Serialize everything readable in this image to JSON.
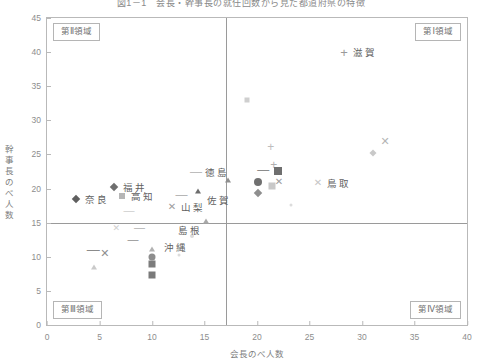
{
  "chart": {
    "title": "図1－1　会長・幹事長の就任回数から見た都道府県の特徴",
    "xlabel": "会長のべ人数",
    "ylabel": "幹事長のべ人数",
    "xlim": [
      0,
      40
    ],
    "ylim": [
      0,
      45
    ],
    "xticks": [
      0,
      5,
      10,
      15,
      20,
      25,
      30,
      35,
      40
    ],
    "yticks": [
      0,
      5,
      10,
      15,
      20,
      25,
      30,
      35,
      40,
      45
    ],
    "divider_x": 17,
    "divider_y": 15,
    "grid": false,
    "legend": "none",
    "axis_color": "#b9b9b9",
    "divider_color": "#9a9a9a",
    "text_color": "#6b6b6b"
  },
  "quadrants": [
    {
      "key": "q1",
      "label": "第Ⅰ領域"
    },
    {
      "key": "q2",
      "label": "第Ⅱ領域"
    },
    {
      "key": "q3",
      "label": "第Ⅲ領域"
    },
    {
      "key": "q4",
      "label": "第Ⅳ領域"
    }
  ],
  "chart_data": {
    "type": "scatter",
    "title": "図1－1　会長・幹事長の就任回数から見た都道府県の特徴",
    "xlabel": "会長のべ人数",
    "ylabel": "幹事長のべ人数",
    "xlim": [
      0,
      40
    ],
    "ylim": [
      0,
      45
    ],
    "xticks": [
      0,
      5,
      10,
      15,
      20,
      25,
      30,
      35,
      40
    ],
    "yticks": [
      0,
      5,
      10,
      15,
      20,
      25,
      30,
      35,
      40,
      45
    ],
    "reference_lines": {
      "vertical_x": 17,
      "horizontal_y": 15
    },
    "quadrant_labels": {
      "top_right": "第Ⅰ領域",
      "top_left": "第Ⅱ領域",
      "bottom_left": "第Ⅲ領域",
      "bottom_right": "第Ⅳ領域"
    },
    "points": [
      {
        "x": 28.3,
        "y": 40.0,
        "marker": "plus",
        "size": 9,
        "color": "#9a9a9a",
        "label": "滋賀",
        "label_dx": 9,
        "label_dy": 0
      },
      {
        "x": 19.0,
        "y": 33.0,
        "marker": "square",
        "size": 5,
        "color": "#cfcfcf",
        "label": ""
      },
      {
        "x": 32.2,
        "y": 27.0,
        "marker": "x",
        "size": 9,
        "color": "#b5b5b5",
        "label": ""
      },
      {
        "x": 21.3,
        "y": 26.2,
        "marker": "plus",
        "size": 8,
        "color": "#bdbdbd",
        "label": ""
      },
      {
        "x": 31.0,
        "y": 25.2,
        "marker": "diamond",
        "size": 5,
        "color": "#c9c9c9",
        "label": ""
      },
      {
        "x": 21.6,
        "y": 23.5,
        "marker": "plus",
        "size": 8,
        "color": "#b0b0b0",
        "label": ""
      },
      {
        "x": 22.0,
        "y": 22.6,
        "marker": "square",
        "size": 8,
        "color": "#6f6f6f",
        "label": ""
      },
      {
        "x": 20.6,
        "y": 22.7,
        "marker": "dash",
        "size": 8,
        "color": "#8c8c8c",
        "label": ""
      },
      {
        "x": 14.2,
        "y": 22.5,
        "marker": "dash",
        "size": 8,
        "color": "#bdbdbd",
        "label": "徳島",
        "label_dx": 9,
        "label_dy": 0
      },
      {
        "x": 17.2,
        "y": 21.2,
        "marker": "tri",
        "size": 7,
        "color": "#8f8f8f",
        "label": ""
      },
      {
        "x": 20.1,
        "y": 21.0,
        "marker": "circle",
        "size": 8,
        "color": "#707070",
        "label": ""
      },
      {
        "x": 22.1,
        "y": 21.0,
        "marker": "x",
        "size": 8,
        "color": "#9d9d9d",
        "label": ""
      },
      {
        "x": 25.8,
        "y": 20.8,
        "marker": "x",
        "size": 8,
        "color": "#c6c6c6",
        "label": "鳥取",
        "label_dx": 9,
        "label_dy": 0
      },
      {
        "x": 21.4,
        "y": 20.4,
        "marker": "square",
        "size": 7,
        "color": "#c8c8c8",
        "label": ""
      },
      {
        "x": 27.1,
        "y": 20.3,
        "marker": "dot",
        "size": 3,
        "color": "#d5d5d5",
        "label": ""
      },
      {
        "x": 6.4,
        "y": 20.3,
        "marker": "diamond",
        "size": 6,
        "color": "#6e6e6e",
        "label": "福井",
        "label_dx": 9,
        "label_dy": 0
      },
      {
        "x": 14.4,
        "y": 19.7,
        "marker": "tri",
        "size": 7,
        "color": "#6d6d6d",
        "label": "佐賀",
        "label_dx": 9,
        "label_dy": 9
      },
      {
        "x": 20.1,
        "y": 19.3,
        "marker": "diamond",
        "size": 6,
        "color": "#8e8e8e",
        "label": ""
      },
      {
        "x": 7.1,
        "y": 18.9,
        "marker": "square",
        "size": 6,
        "color": "#b6b6b6",
        "label": "高知",
        "label_dx": 9,
        "label_dy": 0
      },
      {
        "x": 12.8,
        "y": 19.0,
        "marker": "dash",
        "size": 8,
        "color": "#b6b6b6",
        "label": ""
      },
      {
        "x": 2.8,
        "y": 18.5,
        "marker": "diamond",
        "size": 6,
        "color": "#5f5f5f",
        "label": "奈良",
        "label_dx": 9,
        "label_dy": 0
      },
      {
        "x": 11.9,
        "y": 17.3,
        "marker": "x",
        "size": 8,
        "color": "#9d9d9d",
        "label": "山梨",
        "label_dx": 9,
        "label_dy": 0
      },
      {
        "x": 23.2,
        "y": 17.6,
        "marker": "dot",
        "size": 3,
        "color": "#dcdcdc",
        "label": ""
      },
      {
        "x": 7.8,
        "y": 16.9,
        "marker": "dash",
        "size": 7,
        "color": "#cecece",
        "label": ""
      },
      {
        "x": 15.1,
        "y": 15.2,
        "marker": "tri",
        "size": 7,
        "color": "#a8a8a8",
        "label": "島根",
        "label_dx": -28,
        "label_dy": 9
      },
      {
        "x": 6.6,
        "y": 14.2,
        "marker": "x",
        "size": 7,
        "color": "#cfcfcf",
        "label": ""
      },
      {
        "x": 8.8,
        "y": 14.3,
        "marker": "dash",
        "size": 7,
        "color": "#b0b0b0",
        "label": ""
      },
      {
        "x": 12.9,
        "y": 13.8,
        "marker": "dot",
        "size": 3,
        "color": "#d8d8d8",
        "label": ""
      },
      {
        "x": 8.2,
        "y": 12.6,
        "marker": "dash",
        "size": 7,
        "color": "#8e8e8e",
        "label": ""
      },
      {
        "x": 13.8,
        "y": 13.0,
        "marker": "dot",
        "size": 4,
        "color": "#dadada",
        "label": ""
      },
      {
        "x": 10.0,
        "y": 11.1,
        "marker": "tri",
        "size": 6,
        "color": "#b2b2b2",
        "label": "沖縄",
        "label_dx": 12,
        "label_dy": -2
      },
      {
        "x": 4.4,
        "y": 11.2,
        "marker": "dash",
        "size": 9,
        "color": "#8b8b8b",
        "label": ""
      },
      {
        "x": 5.5,
        "y": 10.6,
        "marker": "x",
        "size": 9,
        "color": "#8f8f8f",
        "label": ""
      },
      {
        "x": 12.6,
        "y": 10.2,
        "marker": "dot",
        "size": 3,
        "color": "#dcdcdc",
        "label": ""
      },
      {
        "x": 10.0,
        "y": 9.9,
        "marker": "circle",
        "size": 7,
        "color": "#8d8d8d",
        "label": ""
      },
      {
        "x": 10.0,
        "y": 9.0,
        "marker": "square",
        "size": 7,
        "color": "#7c7c7c",
        "label": ""
      },
      {
        "x": 4.5,
        "y": 8.5,
        "marker": "tri",
        "size": 6,
        "color": "#cacaca",
        "label": ""
      },
      {
        "x": 10.0,
        "y": 7.4,
        "marker": "square",
        "size": 7,
        "color": "#7a7a7a",
        "label": ""
      }
    ],
    "labeled_prefectures": [
      "滋賀",
      "徳島",
      "鳥取",
      "福井",
      "佐賀",
      "高知",
      "奈良",
      "山梨",
      "島根",
      "沖縄"
    ]
  }
}
